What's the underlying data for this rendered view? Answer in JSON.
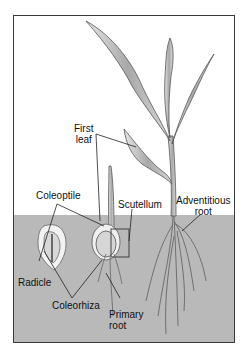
{
  "diagram": {
    "labels": {
      "first_leaf_line1": "First",
      "first_leaf_line2": "leaf",
      "coleoptile": "Coleoptile",
      "scutellum": "Scutellum",
      "adventitious_line1": "Adventitious",
      "adventitious_line2": "root",
      "radicle": "Radicle",
      "coleorhiza": "Coleorhiza",
      "primary_line1": "Primary",
      "primary_line2": "root"
    },
    "colors": {
      "soil": "#b9b9b9",
      "frame": "#3a3a3a",
      "leaf": "#9a9a9a",
      "leader_line": "#222222"
    }
  }
}
